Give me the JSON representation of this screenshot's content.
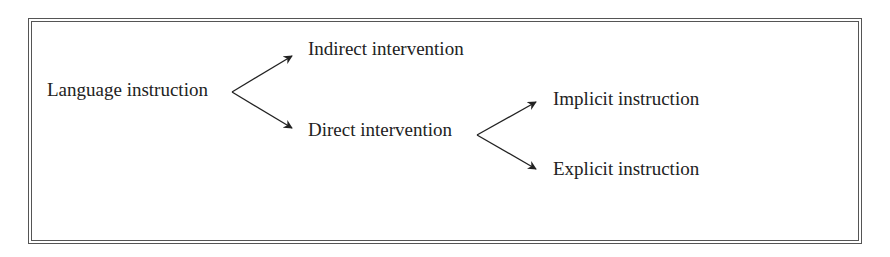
{
  "diagram": {
    "type": "tree",
    "root": {
      "label": "Language instruction",
      "children": [
        {
          "label": "Indirect intervention"
        },
        {
          "label": "Direct intervention",
          "children": [
            {
              "label": "Implicit instruction"
            },
            {
              "label": "Explicit instruction"
            }
          ]
        }
      ]
    },
    "nodes": {
      "language_instruction": "Language instruction",
      "indirect_intervention": "Indirect intervention",
      "direct_intervention": "Direct intervention",
      "implicit_instruction": "Implicit instruction",
      "explicit_instruction": "Explicit instruction"
    },
    "edges": [
      {
        "from": "Language instruction",
        "to": "Indirect intervention"
      },
      {
        "from": "Language instruction",
        "to": "Direct intervention"
      },
      {
        "from": "Direct intervention",
        "to": "Implicit instruction"
      },
      {
        "from": "Direct intervention",
        "to": "Explicit instruction"
      }
    ],
    "colors": {
      "text": "#222222",
      "arrow": "#222222",
      "border": "#555555",
      "background": "#ffffff"
    }
  }
}
